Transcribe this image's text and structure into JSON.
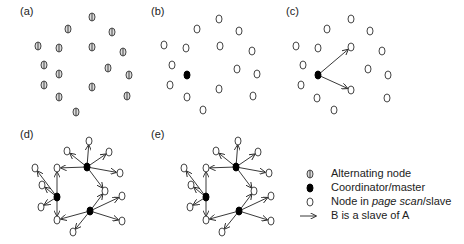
{
  "panels": [
    {
      "id": "a",
      "label": "(a)",
      "x": 20,
      "y": 12,
      "type": "alternating"
    },
    {
      "id": "b",
      "label": "(b)",
      "x": 151,
      "y": 12,
      "type": "single-master"
    },
    {
      "id": "c",
      "label": "(c)",
      "x": 286,
      "y": 12,
      "type": "master-with-slaves"
    },
    {
      "id": "d",
      "label": "(d)",
      "x": 20,
      "y": 135,
      "type": "scatternet"
    },
    {
      "id": "e",
      "label": "(e)",
      "x": 151,
      "y": 135,
      "type": "scatternet"
    }
  ],
  "panel_a": {
    "nodes": [
      [
        92,
        17
      ],
      [
        68,
        29
      ],
      [
        112,
        32
      ],
      [
        38,
        46
      ],
      [
        59,
        48
      ],
      [
        92,
        47
      ],
      [
        123,
        52
      ],
      [
        44,
        65
      ],
      [
        59,
        74
      ],
      [
        108,
        68
      ],
      [
        129,
        75
      ],
      [
        44,
        85
      ],
      [
        92,
        87
      ],
      [
        59,
        97
      ],
      [
        127,
        96
      ],
      [
        76,
        112
      ]
    ]
  },
  "panel_b": {
    "master": [
      187,
      75
    ],
    "slaves": [
      [
        219,
        19
      ],
      [
        197,
        29
      ],
      [
        239,
        31
      ],
      [
        164,
        45
      ],
      [
        186,
        48
      ],
      [
        220,
        46
      ],
      [
        252,
        51
      ],
      [
        172,
        65
      ],
      [
        237,
        69
      ],
      [
        257,
        74
      ],
      [
        170,
        85
      ],
      [
        219,
        89
      ],
      [
        187,
        97
      ],
      [
        253,
        96
      ],
      [
        203,
        110
      ]
    ]
  },
  "panel_c": {
    "master": [
      318,
      75
    ],
    "slaves": [
      [
        351,
        19
      ],
      [
        327,
        29
      ],
      [
        370,
        31
      ],
      [
        296,
        46
      ],
      [
        318,
        48
      ],
      [
        351,
        47
      ],
      [
        382,
        51
      ],
      [
        303,
        65
      ],
      [
        368,
        69
      ],
      [
        388,
        75
      ],
      [
        301,
        85
      ],
      [
        351,
        90
      ],
      [
        317,
        98
      ],
      [
        387,
        98
      ],
      [
        334,
        110
      ]
    ],
    "links": [
      [
        351,
        47
      ],
      [
        351,
        90
      ]
    ]
  },
  "panel_d": {
    "offset_x": 0,
    "masters": [
      [
        87,
        167
      ],
      [
        57,
        197
      ],
      [
        90,
        211
      ]
    ],
    "slaves": [
      [
        89,
        141
      ],
      [
        67,
        151
      ],
      [
        109,
        152
      ],
      [
        120,
        173
      ],
      [
        35,
        168
      ],
      [
        57,
        168
      ],
      [
        105,
        191
      ],
      [
        42,
        185
      ],
      [
        41,
        207
      ],
      [
        57,
        220
      ],
      [
        122,
        196
      ],
      [
        122,
        221
      ],
      [
        73,
        232
      ]
    ],
    "links": [
      [
        0,
        0
      ],
      [
        0,
        1
      ],
      [
        0,
        2
      ],
      [
        0,
        3
      ],
      [
        0,
        5
      ],
      [
        0,
        6
      ],
      [
        1,
        4
      ],
      [
        1,
        5
      ],
      [
        1,
        7
      ],
      [
        1,
        8
      ],
      [
        1,
        9
      ],
      [
        2,
        6
      ],
      [
        2,
        9
      ],
      [
        2,
        10
      ],
      [
        2,
        11
      ],
      [
        2,
        12
      ]
    ]
  },
  "panel_e": {
    "offset_x": 149
  },
  "legend": {
    "items": [
      {
        "symbol": "alternating-node",
        "label": "Alternating node",
        "y": 174
      },
      {
        "symbol": "master-node",
        "label": "Coordinator/master",
        "y": 188
      },
      {
        "symbol": "slave-node",
        "label_pre": "Node in ",
        "label_italic": "page scan",
        "label_post": "/slave",
        "y": 202
      },
      {
        "symbol": "arrow",
        "label": "B is a slave of A",
        "y": 216
      }
    ]
  }
}
